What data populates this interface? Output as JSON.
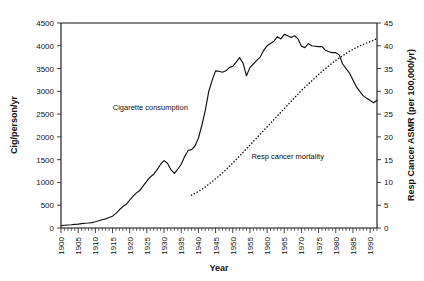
{
  "chart_data": {
    "type": "line",
    "title": "",
    "xlabel": "Year",
    "ylabel": "Cig/person/yr",
    "y2label": "Resp Cancer ASMR (per 100,000/yr)",
    "xlim": [
      1900,
      1992
    ],
    "ylim": [
      0,
      4500
    ],
    "y2lim": [
      0,
      45
    ],
    "grid": false,
    "legend_position": "inline-annotations",
    "xticks": [
      1900,
      1905,
      1910,
      1915,
      1920,
      1925,
      1930,
      1935,
      1940,
      1945,
      1950,
      1955,
      1960,
      1965,
      1970,
      1975,
      1980,
      1985,
      1990
    ],
    "xtick_labels": [
      "1900",
      "1905",
      "1910",
      "1915",
      "1920",
      "1925",
      "1930",
      "1935",
      "1940",
      "1945",
      "1950",
      "1955",
      "1960",
      "1965",
      "1970",
      "1975",
      "1980",
      "1985",
      "1990"
    ],
    "yticks": [
      0,
      500,
      1000,
      1500,
      2000,
      2500,
      3000,
      3500,
      4000,
      4500
    ],
    "ytick_labels": [
      "0",
      "500",
      "1000",
      "1500",
      "2000",
      "2500",
      "3000",
      "3500",
      "4000",
      "4500"
    ],
    "y2ticks": [
      0,
      5,
      10,
      15,
      20,
      25,
      30,
      35,
      40,
      45
    ],
    "y2tick_labels": [
      "0",
      "5",
      "10",
      "15",
      "20",
      "25",
      "30",
      "35",
      "40",
      "45"
    ],
    "xtick_minor_step": 1,
    "annotations": [
      {
        "text": "Cigarette consumption",
        "x": 1926,
        "y": 2600,
        "axis": "left"
      },
      {
        "text": "Resp cancer mortality",
        "x": 1966,
        "y": 1520,
        "axis": "left"
      }
    ],
    "series": [
      {
        "name": "Cigarette consumption",
        "style": "solid",
        "axis": "left",
        "units": "Cig/person/yr",
        "x": [
          1900,
          1901,
          1902,
          1903,
          1904,
          1905,
          1906,
          1907,
          1908,
          1909,
          1910,
          1911,
          1912,
          1913,
          1914,
          1915,
          1916,
          1917,
          1918,
          1919,
          1920,
          1921,
          1922,
          1923,
          1924,
          1925,
          1926,
          1927,
          1928,
          1929,
          1930,
          1931,
          1932,
          1933,
          1934,
          1935,
          1936,
          1937,
          1938,
          1939,
          1940,
          1941,
          1942,
          1943,
          1944,
          1945,
          1946,
          1947,
          1948,
          1949,
          1950,
          1951,
          1952,
          1953,
          1954,
          1955,
          1956,
          1957,
          1958,
          1959,
          1960,
          1961,
          1962,
          1963,
          1964,
          1965,
          1966,
          1967,
          1968,
          1969,
          1970,
          1971,
          1972,
          1973,
          1974,
          1975,
          1976,
          1977,
          1978,
          1979,
          1980,
          1981,
          1982,
          1983,
          1984,
          1985,
          1986,
          1987,
          1988,
          1989,
          1990,
          1991,
          1992
        ],
        "values": [
          54,
          60,
          66,
          72,
          80,
          86,
          95,
          105,
          110,
          118,
          138,
          160,
          180,
          200,
          230,
          260,
          320,
          400,
          470,
          520,
          610,
          700,
          770,
          830,
          930,
          1030,
          1120,
          1180,
          1280,
          1400,
          1480,
          1420,
          1280,
          1200,
          1290,
          1400,
          1570,
          1700,
          1720,
          1800,
          1970,
          2250,
          2580,
          2990,
          3240,
          3450,
          3440,
          3420,
          3450,
          3520,
          3550,
          3640,
          3740,
          3620,
          3340,
          3520,
          3600,
          3680,
          3750,
          3900,
          4000,
          4050,
          4100,
          4200,
          4150,
          4250,
          4220,
          4180,
          4220,
          4150,
          3990,
          3960,
          4050,
          4000,
          3990,
          3980,
          3980,
          3900,
          3870,
          3850,
          3850,
          3800,
          3600,
          3500,
          3400,
          3250,
          3100,
          3000,
          2900,
          2850,
          2800,
          2750,
          2800
        ]
      },
      {
        "name": "Resp cancer mortality",
        "style": "dotted",
        "axis": "right",
        "units": "per 100,000/yr",
        "x": [
          1938,
          1939,
          1940,
          1941,
          1942,
          1943,
          1944,
          1945,
          1946,
          1947,
          1948,
          1949,
          1950,
          1951,
          1952,
          1953,
          1954,
          1955,
          1956,
          1957,
          1958,
          1959,
          1960,
          1961,
          1962,
          1963,
          1964,
          1965,
          1966,
          1967,
          1968,
          1969,
          1970,
          1971,
          1972,
          1973,
          1974,
          1975,
          1976,
          1977,
          1978,
          1979,
          1980,
          1981,
          1982,
          1983,
          1984,
          1985,
          1986,
          1987,
          1988,
          1989,
          1990,
          1991,
          1992
        ],
        "values": [
          7.2,
          7.6,
          8.0,
          8.5,
          9.0,
          9.6,
          10.2,
          10.8,
          11.4,
          12.1,
          12.8,
          13.5,
          14.3,
          15.0,
          15.8,
          16.6,
          17.4,
          18.2,
          19.0,
          19.8,
          20.6,
          21.4,
          22.2,
          23.0,
          23.8,
          24.6,
          25.4,
          26.2,
          27.0,
          27.8,
          28.6,
          29.4,
          30.2,
          30.9,
          31.6,
          32.3,
          33.0,
          33.7,
          34.4,
          35.0,
          35.6,
          36.2,
          36.8,
          37.3,
          37.8,
          38.3,
          38.8,
          39.2,
          39.6,
          40.0,
          40.3,
          40.6,
          40.9,
          41.2,
          41.6
        ]
      }
    ]
  }
}
